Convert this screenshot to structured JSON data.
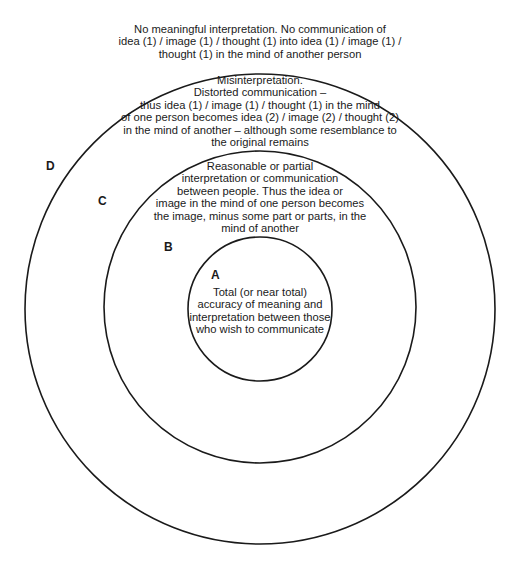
{
  "diagram": {
    "zones": [
      {
        "id": "D",
        "label": "D",
        "lines": [
          "No meaningful interpretation.  No communication of",
          "idea (1) / image (1) / thought (1) into idea (1) / image (1) /",
          "thought (1) in the mind of another person"
        ]
      },
      {
        "id": "C",
        "label": "C",
        "lines": [
          "Misinterpretation.",
          "Distorted communication –",
          "thus idea (1) / image (1) / thought (1) in the mind",
          "of one person becomes idea (2) / image (2) / thought (2)",
          "in the mind of another – although some resemblance to",
          "the original remains"
        ]
      },
      {
        "id": "B",
        "label": "B",
        "lines": [
          "Reasonable or partial",
          "interpretation or communication",
          "between people.  Thus the idea or",
          "image in the mind of one person becomes",
          "the image, minus some part or parts, in the",
          "mind of another"
        ]
      },
      {
        "id": "A",
        "label": "A",
        "lines": [
          "Total (or near total)",
          "accuracy of meaning and",
          "interpretation between those",
          "who wish to communicate"
        ]
      }
    ],
    "circles": {
      "outer": {
        "cx": 260,
        "cy": 309,
        "r": 235
      },
      "middle": {
        "cx": 260,
        "cy": 307,
        "r": 156
      },
      "inner": {
        "cx": 260,
        "cy": 309,
        "r": 72
      }
    },
    "stroke_color": "#1a1a1a",
    "background": "#ffffff"
  }
}
